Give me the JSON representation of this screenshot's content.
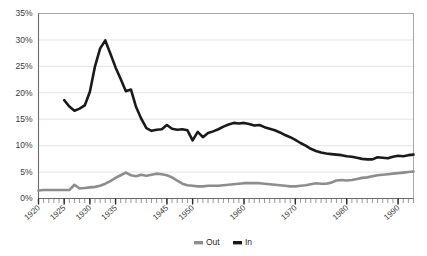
{
  "chart_data": {
    "type": "line",
    "title": "",
    "xlabel": "",
    "ylabel": "",
    "xlim": [
      1920,
      1993
    ],
    "ylim": [
      0,
      35
    ],
    "grid": true,
    "legend_position": "bottom-center",
    "y_tick_labels": [
      "35%",
      "30%",
      "25%",
      "20%",
      "15%",
      "10%",
      "5%",
      "0%"
    ],
    "y_tick_values": [
      35,
      30,
      25,
      20,
      15,
      10,
      5,
      0
    ],
    "x_tick_labels": [
      "1920",
      "1925",
      "1930",
      "1935",
      "1945",
      "1950",
      "1960",
      "1970",
      "1980",
      "1990"
    ],
    "x_tick_values": [
      1920,
      1925,
      1930,
      1935,
      1945,
      1950,
      1960,
      1970,
      1980,
      1990
    ],
    "x_minor_tick_step": 1,
    "series": [
      {
        "name": "Out",
        "color": "#8d8d8d",
        "x": [
          1920,
          1921,
          1922,
          1923,
          1924,
          1925,
          1926,
          1927,
          1928,
          1929,
          1930,
          1931,
          1932,
          1933,
          1934,
          1935,
          1936,
          1937,
          1938,
          1939,
          1940,
          1941,
          1942,
          1943,
          1944,
          1945,
          1946,
          1947,
          1948,
          1949,
          1950,
          1951,
          1952,
          1953,
          1954,
          1955,
          1956,
          1957,
          1958,
          1959,
          1960,
          1961,
          1962,
          1963,
          1964,
          1965,
          1966,
          1967,
          1968,
          1969,
          1970,
          1971,
          1972,
          1973,
          1974,
          1975,
          1976,
          1977,
          1978,
          1979,
          1980,
          1981,
          1982,
          1983,
          1984,
          1985,
          1986,
          1987,
          1988,
          1989,
          1990,
          1991,
          1992,
          1993
        ],
        "values": [
          1.5,
          1.6,
          1.6,
          1.6,
          1.6,
          1.6,
          1.6,
          2.6,
          1.9,
          2.0,
          2.1,
          2.2,
          2.4,
          2.8,
          3.3,
          3.9,
          4.4,
          4.9,
          4.4,
          4.2,
          4.5,
          4.3,
          4.5,
          4.7,
          4.6,
          4.4,
          4.0,
          3.4,
          2.8,
          2.5,
          2.4,
          2.3,
          2.3,
          2.4,
          2.4,
          2.4,
          2.5,
          2.6,
          2.7,
          2.8,
          2.9,
          2.9,
          2.9,
          2.9,
          2.8,
          2.7,
          2.6,
          2.5,
          2.4,
          2.3,
          2.3,
          2.4,
          2.5,
          2.7,
          2.9,
          2.8,
          2.8,
          3.0,
          3.4,
          3.5,
          3.4,
          3.5,
          3.7,
          3.9,
          4.0,
          4.2,
          4.4,
          4.5,
          4.6,
          4.7,
          4.8,
          4.9,
          5.0,
          5.1
        ]
      },
      {
        "name": "In",
        "color": "#1a1a1a",
        "x": [
          1925,
          1926,
          1927,
          1928,
          1929,
          1930,
          1931,
          1932,
          1933,
          1934,
          1935,
          1936,
          1937,
          1938,
          1939,
          1940,
          1941,
          1942,
          1943,
          1944,
          1945,
          1946,
          1947,
          1948,
          1949,
          1950,
          1951,
          1952,
          1953,
          1954,
          1955,
          1956,
          1957,
          1958,
          1959,
          1960,
          1961,
          1962,
          1963,
          1964,
          1965,
          1966,
          1967,
          1968,
          1969,
          1970,
          1971,
          1972,
          1973,
          1974,
          1975,
          1976,
          1977,
          1978,
          1979,
          1980,
          1981,
          1982,
          1983,
          1984,
          1985,
          1986,
          1987,
          1988,
          1989,
          1990,
          1991,
          1992,
          1993
        ],
        "values": [
          18.6,
          17.4,
          16.6,
          17.0,
          17.6,
          20.2,
          25.0,
          28.4,
          29.9,
          27.4,
          24.8,
          22.6,
          20.3,
          20.6,
          17.3,
          15.1,
          13.3,
          12.8,
          13.0,
          13.1,
          13.9,
          13.2,
          13.0,
          13.1,
          12.9,
          11.0,
          12.6,
          11.6,
          12.4,
          12.7,
          13.1,
          13.6,
          14.0,
          14.3,
          14.2,
          14.3,
          14.1,
          13.8,
          13.9,
          13.5,
          13.2,
          12.9,
          12.5,
          12.0,
          11.6,
          11.1,
          10.5,
          10.0,
          9.4,
          9.0,
          8.7,
          8.5,
          8.4,
          8.3,
          8.2,
          8.0,
          7.9,
          7.7,
          7.5,
          7.4,
          7.4,
          7.8,
          7.7,
          7.6,
          7.9,
          8.1,
          8.0,
          8.2,
          8.3
        ]
      }
    ],
    "legend": [
      {
        "label": "Out",
        "color": "#8d8d8d"
      },
      {
        "label": "In",
        "color": "#1a1a1a"
      }
    ]
  }
}
